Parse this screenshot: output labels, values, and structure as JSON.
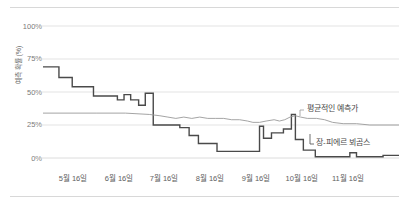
{
  "chart_data": {
    "type": "line",
    "title": "",
    "xlabel": "",
    "ylabel": "예측 확률 (%)",
    "ylim": [
      0,
      100
    ],
    "grid": true,
    "legend_position": "inline-annotation",
    "ytick_labels": [
      "0%",
      "25%",
      "50%",
      "75%",
      "100%"
    ],
    "ytick_values": [
      0,
      25,
      50,
      75,
      100
    ],
    "categories": [
      "5월 16일",
      "6월 16일",
      "7월 16일",
      "8월 16일",
      "9월 16일",
      "10월 16일",
      "11월 16일"
    ],
    "xtick_labels": [
      "5월 16일",
      "6월 16일",
      "7월 16일",
      "8월 16일",
      "9월 16일",
      "10월 16일",
      "11월 16일"
    ],
    "annotations": [
      {
        "text": "평균적인 예측가",
        "series": "평균적인 예측가"
      },
      {
        "text": "장-피에르 뵈곰스",
        "series": "장-피에르 뵈곰스"
      }
    ],
    "series": [
      {
        "name": "장-피에르 뵈곰스",
        "color": "#4a4a4a",
        "style": "step",
        "points": [
          [
            0,
            69
          ],
          [
            12,
            69
          ],
          [
            12,
            61
          ],
          [
            22,
            61
          ],
          [
            22,
            54
          ],
          [
            38,
            54
          ],
          [
            38,
            47
          ],
          [
            56,
            47
          ],
          [
            56,
            44
          ],
          [
            61,
            44
          ],
          [
            61,
            48
          ],
          [
            66,
            48
          ],
          [
            66,
            44
          ],
          [
            72,
            44
          ],
          [
            72,
            40
          ],
          [
            77,
            40
          ],
          [
            77,
            49
          ],
          [
            83,
            49
          ],
          [
            83,
            25
          ],
          [
            103,
            25
          ],
          [
            103,
            23
          ],
          [
            110,
            23
          ],
          [
            110,
            17
          ],
          [
            117,
            17
          ],
          [
            117,
            11
          ],
          [
            131,
            11
          ],
          [
            131,
            5
          ],
          [
            155,
            5
          ],
          [
            163,
            5
          ],
          [
            163,
            24
          ],
          [
            166,
            24
          ],
          [
            166,
            15
          ],
          [
            172,
            15
          ],
          [
            172,
            19
          ],
          [
            181,
            19
          ],
          [
            181,
            22
          ],
          [
            187,
            22
          ],
          [
            187,
            33
          ],
          [
            190,
            33
          ],
          [
            190,
            14
          ],
          [
            196,
            14
          ],
          [
            196,
            6
          ],
          [
            205,
            6
          ],
          [
            205,
            1
          ],
          [
            231,
            1
          ],
          [
            231,
            4
          ],
          [
            236,
            4
          ],
          [
            236,
            1
          ],
          [
            256,
            1
          ],
          [
            256,
            2
          ],
          [
            268,
            2
          ]
        ]
      },
      {
        "name": "평균적인 예측가",
        "color": "#9a9a9a",
        "style": "line",
        "points": [
          [
            0,
            34
          ],
          [
            40,
            34
          ],
          [
            62,
            34
          ],
          [
            80,
            33
          ],
          [
            88,
            32
          ],
          [
            94,
            31
          ],
          [
            100,
            30
          ],
          [
            106,
            31
          ],
          [
            112,
            30
          ],
          [
            118,
            31
          ],
          [
            124,
            30
          ],
          [
            130,
            30
          ],
          [
            136,
            30
          ],
          [
            142,
            29
          ],
          [
            148,
            29
          ],
          [
            154,
            28
          ],
          [
            158,
            27
          ],
          [
            163,
            27
          ],
          [
            168,
            28
          ],
          [
            174,
            29
          ],
          [
            178,
            28
          ],
          [
            182,
            29
          ],
          [
            186,
            31
          ],
          [
            190,
            32
          ],
          [
            194,
            31
          ],
          [
            199,
            30
          ],
          [
            206,
            30
          ],
          [
            212,
            29
          ],
          [
            218,
            27
          ],
          [
            226,
            26
          ],
          [
            236,
            26
          ],
          [
            246,
            25
          ],
          [
            256,
            25
          ],
          [
            268,
            25
          ]
        ]
      }
    ]
  }
}
